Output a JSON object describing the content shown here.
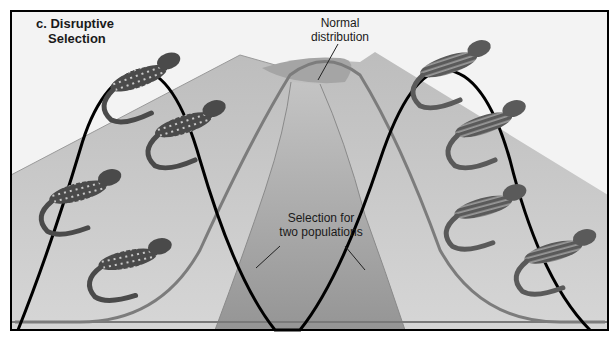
{
  "figure": {
    "panel_title": {
      "line1": "c. Disruptive",
      "line2": "Selection"
    },
    "labels": {
      "normal_distribution": {
        "line1": "Normal",
        "line2": "distribution"
      },
      "selection": {
        "line1": "Selection for",
        "line2": "two populations"
      }
    },
    "curves": {
      "normal_distribution_color": "#7a7a7a",
      "disruptive_selection_color": "#000000"
    },
    "populations": {
      "left": {
        "description": "spotted lizards",
        "count": 4
      },
      "right": {
        "description": "striped lizards",
        "count": 4
      }
    },
    "colors": {
      "frame": "#000000",
      "sky": "#f2f2f2",
      "mountain": "#c8c8c8",
      "mound": "#a9a9a9"
    }
  }
}
